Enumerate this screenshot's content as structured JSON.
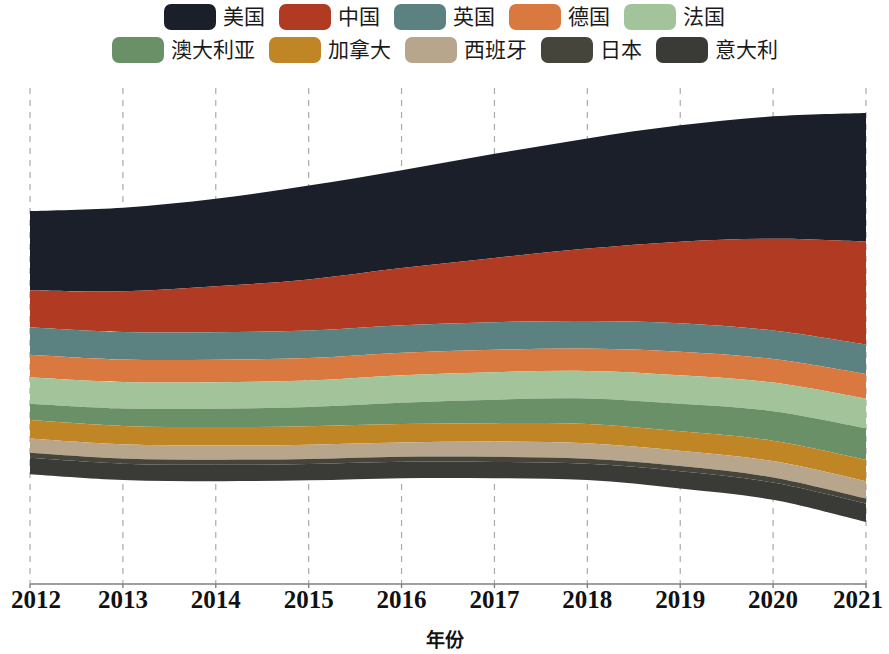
{
  "chart_data": {
    "type": "area",
    "subtype": "streamgraph",
    "title": "",
    "xlabel": "年份",
    "ylabel": "",
    "grid": "vertical-dashed",
    "legend_position": "top",
    "offset": "wiggle",
    "x": [
      2012,
      2013,
      2014,
      2015,
      2016,
      2017,
      2018,
      2019,
      2020,
      2021
    ],
    "categories": [
      "2012",
      "2013",
      "2014",
      "2015",
      "2016",
      "2017",
      "2018",
      "2019",
      "2020",
      "2021"
    ],
    "series": [
      {
        "name": "美国",
        "color": "#1b1f2a",
        "values": [
          78,
          82,
          86,
          92,
          96,
          102,
          108,
          114,
          120,
          126
        ]
      },
      {
        "name": "中国",
        "color": "#b03a22",
        "values": [
          36,
          40,
          45,
          50,
          56,
          63,
          71,
          80,
          90,
          101
        ]
      },
      {
        "name": "英国",
        "color": "#5b8281",
        "values": [
          27,
          27,
          27,
          27,
          27,
          27,
          27,
          28,
          28,
          29
        ]
      },
      {
        "name": "德国",
        "color": "#d9793f",
        "values": [
          22,
          22,
          22,
          22,
          22,
          22,
          22,
          23,
          23,
          24
        ]
      },
      {
        "name": "法国",
        "color": "#a3c49a",
        "values": [
          26,
          26,
          26,
          26,
          27,
          27,
          27,
          28,
          28,
          29
        ]
      },
      {
        "name": "澳大利亚",
        "color": "#6a9068",
        "values": [
          16,
          17,
          18,
          19,
          21,
          23,
          25,
          27,
          29,
          31
        ]
      },
      {
        "name": "加拿大",
        "color": "#c08524",
        "values": [
          18,
          18,
          18,
          18,
          18,
          18,
          19,
          19,
          20,
          21
        ]
      },
      {
        "name": "西班牙",
        "color": "#b7a68c",
        "values": [
          14,
          14,
          14,
          14,
          14,
          15,
          15,
          15,
          16,
          17
        ]
      },
      {
        "name": "日本",
        "color": "#45453c",
        "values": [
          5,
          5,
          5,
          5,
          5,
          5,
          5,
          5,
          5,
          5
        ]
      },
      {
        "name": "意大利",
        "color": "#3a3a37",
        "values": [
          16,
          16,
          16,
          16,
          16,
          16,
          16,
          17,
          17,
          18
        ]
      }
    ],
    "xlim": [
      2012,
      2021
    ],
    "tick_labels": [
      "2012",
      "2013",
      "2014",
      "2015",
      "2016",
      "2017",
      "2018",
      "2019",
      "2020",
      "2021"
    ]
  },
  "legend": {
    "rows": [
      [
        {
          "label": "美国",
          "color": "#1b1f2a"
        },
        {
          "label": "中国",
          "color": "#b03a22"
        },
        {
          "label": "英国",
          "color": "#5b8281"
        },
        {
          "label": "德国",
          "color": "#d9793f"
        },
        {
          "label": "法国",
          "color": "#a3c49a"
        }
      ],
      [
        {
          "label": "澳大利亚",
          "color": "#6a9068"
        },
        {
          "label": "加拿大",
          "color": "#c08524"
        },
        {
          "label": "西班牙",
          "color": "#b7a68c"
        },
        {
          "label": "日本",
          "color": "#45453c"
        },
        {
          "label": "意大利",
          "color": "#3a3a37"
        }
      ]
    ]
  },
  "axis": {
    "x_title": "年份",
    "ticks": [
      "2012",
      "2013",
      "2014",
      "2015",
      "2016",
      "2017",
      "2018",
      "2019",
      "2020",
      "2021"
    ],
    "axis_line_color": "#808080",
    "grid_color": "#aaaaaa"
  }
}
